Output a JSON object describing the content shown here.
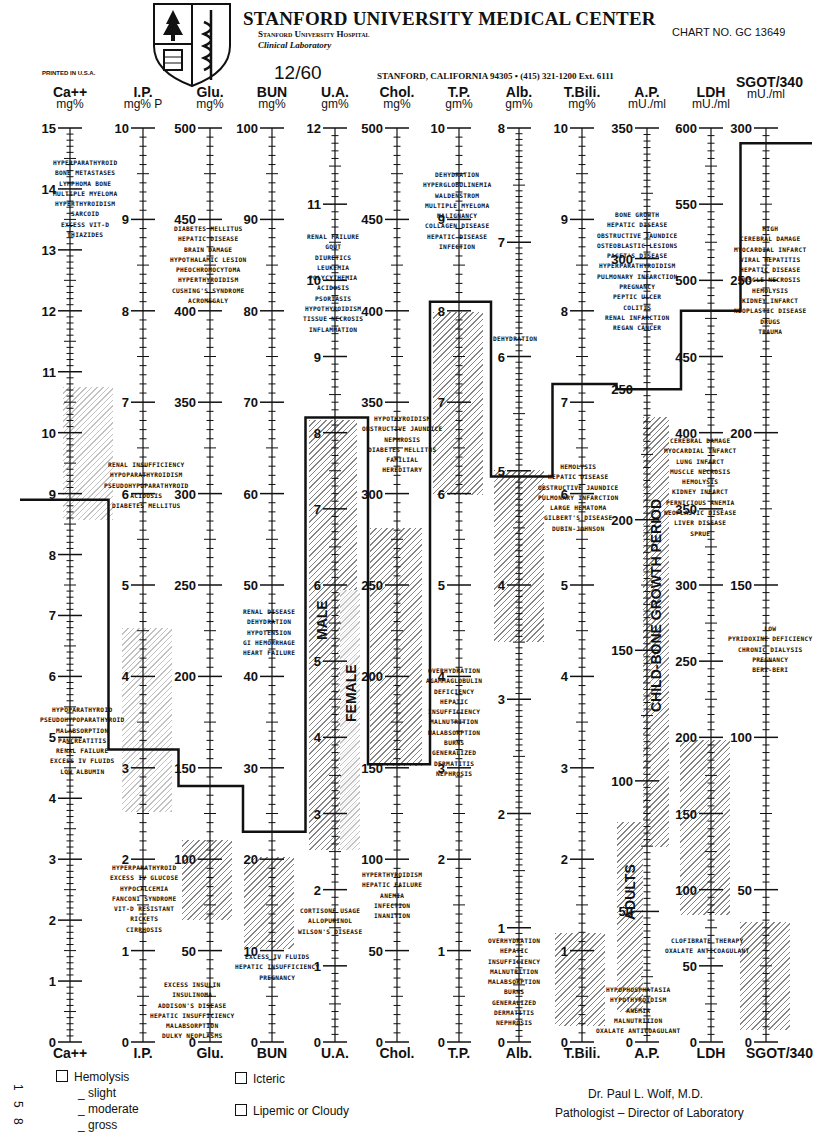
{
  "header": {
    "title": "STANFORD UNIVERSITY MEDICAL CENTER",
    "subtitle": "Stanford University Hospital",
    "department": "Clinical Laboratory",
    "chart_no": "CHART NO. GC 13649",
    "date": "12/60",
    "address": "STANFORD, CALIFORNIA 94305 • (415) 321-1200 Ext. 6111",
    "printed": "PRINTED IN U.S.A."
  },
  "legend": {
    "hemolysis": "Hemolysis",
    "slight": "_ slight",
    "moderate": "_ moderate",
    "gross": "_ gross",
    "icteric": "Icteric",
    "lipemic": "Lipemic or Cloudy",
    "side_numbers": [
      "1",
      "5",
      "8"
    ]
  },
  "signature": {
    "name": "Dr. Paul L. Wolf, M.D.",
    "title": "Pathologist – Director of Laboratory"
  },
  "band_labels": {
    "male": "MALE",
    "female": "FEMALE",
    "child": "CHILD-BONE GROWTH PERIOD",
    "adults": "ADULTS"
  },
  "chart_data": {
    "type": "line",
    "subtitle": "Patient step-line across 12 analytes with normal ranges (hatched)",
    "x": [
      "Ca++",
      "I.P.",
      "Glu.",
      "BUN",
      "U.A.",
      "Chol.",
      "T.P.",
      "Alb.",
      "T.Bili.",
      "A.P.",
      "LDH",
      "SGOT/340"
    ],
    "units": [
      "mg%",
      "mg% P",
      "mg%",
      "mg%",
      "gm%",
      "mg%",
      "gm%",
      "gm%",
      "mg%",
      "mU./ml",
      "mU./ml",
      "mU./ml"
    ],
    "axis_max": [
      15,
      10,
      500,
      100,
      12,
      500,
      10,
      8,
      10,
      350,
      600,
      300
    ],
    "axis_labels": [
      [
        "0",
        "1",
        "2",
        "3",
        "4",
        "5",
        "6",
        "7",
        "8",
        "9",
        "10",
        "11",
        "12",
        "13",
        "14",
        "15"
      ],
      [
        "0",
        "1",
        "2",
        "3",
        "4",
        "5",
        "6",
        "7",
        "8",
        "9",
        "10"
      ],
      [
        "0",
        "50",
        "100",
        "150",
        "200",
        "250",
        "300",
        "350",
        "400",
        "450",
        "500"
      ],
      [
        "0",
        "10",
        "20",
        "30",
        "40",
        "50",
        "60",
        "70",
        "80",
        "90",
        "100"
      ],
      [
        "0",
        "1",
        "2",
        "3",
        "4",
        "5",
        "6",
        "7",
        "8",
        "9",
        "10",
        "11",
        "12"
      ],
      [
        "0",
        "50",
        "100",
        "150",
        "200",
        "250",
        "300",
        "350",
        "400",
        "450",
        "500"
      ],
      [
        "0",
        "1",
        "2",
        "3",
        "4",
        "5",
        "6",
        "7",
        "8",
        "9",
        "10"
      ],
      [
        "0",
        "1",
        "2",
        "3",
        "4",
        "5",
        "6",
        "7",
        "8"
      ],
      [
        "0",
        "1",
        "2",
        "3",
        "4",
        "5",
        "6",
        "7",
        "8",
        "9",
        "10"
      ],
      [
        "0",
        "50",
        "100",
        "150",
        "200",
        "250",
        "300",
        "350"
      ],
      [
        "0",
        "50",
        "100",
        "150",
        "200",
        "250",
        "300",
        "350",
        "400",
        "450",
        "500",
        "550",
        "600"
      ],
      [
        "0",
        "50",
        "100",
        "150",
        "200",
        "250",
        "300"
      ]
    ],
    "series": [
      {
        "name": "Patient result",
        "values": [
          8.9,
          3.2,
          140,
          23,
          8.2,
          152,
          8.1,
          4.95,
          7.2,
          250,
          480,
          295
        ]
      },
      {
        "name": "Normal low",
        "values": [
          8.5,
          2.5,
          65,
          10,
          3.0,
          150,
          6.0,
          3.5,
          0.1,
          30,
          90,
          5
        ]
      },
      {
        "name": "Normal high",
        "values": [
          10.6,
          4.5,
          100,
          20,
          7.0,
          270,
          8.0,
          5.0,
          1.2,
          85,
          200,
          40
        ]
      }
    ],
    "sex_ranges": {
      "U.A.": {
        "male": [
          2.5,
          8.0
        ],
        "female": [
          2.0,
          6.0
        ]
      }
    },
    "ap_ranges": {
      "child_bone_growth": [
        70,
        215
      ],
      "adults": [
        20,
        85
      ]
    },
    "annotations": {
      "Ca++ high": [
        "HYPERPARATHYROID",
        "BONE METASTASES",
        "LYMPHOMA BONE",
        "MULTIPLE MYELOMA",
        "HYPERTHYROIDISM",
        "SARCOID",
        "EXCESS VIT-D",
        "THIAZIDES"
      ],
      "Ca++ low": [
        "HYPOPARATHYROID",
        "PSEUDOHYPOPARATHYROID",
        "MALABSORPTION",
        "PANCREATITIS",
        "RENAL FAILURE",
        "EXCESS IV FLUIDS",
        "LOW ALBUMIN"
      ],
      "I.P. high": [
        "RENAL INSUFFICIENCY",
        "HYPOPARATHYROIDISM",
        "PSEUDOHYPOPARATHYROID",
        "ACIDOSIS",
        "DIABETES MELLITUS"
      ],
      "I.P. low": [
        "HYPERPARATHYROID",
        "EXCESS IV GLUCOSE",
        "HYPOCALCEMIA",
        "FANCONI SYNDROME",
        "VIT-D RESISTANT",
        "RICKETS",
        "CIRRHOSIS"
      ],
      "Glu. high": [
        "DIABETES MELLITUS",
        "HEPATIC DISEASE",
        "BRAIN DAMAGE",
        "HYPOTHALAMIC LESION",
        "PHEOCHROMOCYTOMA",
        "HYPERTHYROIDISM",
        "CUSHING'S SYNDROME",
        "ACROMEGALY"
      ],
      "Glu. low": [
        "EXCESS INSULIN",
        "INSULINOMA",
        "ADDISON'S DISEASE",
        "HEPATIC INSUFFICIENCY",
        "MALABSORPTION",
        "DULKY NEOPLASMS"
      ],
      "BUN high": [
        "RENAL DISEASE",
        "DEHYDRATION",
        "HYPOTENSION",
        "GI HEMORRHAGE",
        "HEART FAILURE"
      ],
      "BUN low": [
        "EXCESS IV FLUIDS",
        "HEPATIC INSUFFICIENCY",
        "PREGNANCY"
      ],
      "U.A. high": [
        "RENAL FAILURE",
        "GOUT",
        "DIURETICS",
        "LEUKEMIA",
        "POLYCYTHEMIA",
        "ACIDOSIS",
        "PSORIASIS",
        "HYPOTHYROIDISM",
        "TISSUE NECROSIS",
        "INFLAMMATION"
      ],
      "U.A. low": [
        "CORTISONE USAGE",
        "ALLOPURINOL",
        "WILSON'S DISEASE"
      ],
      "Chol. high": [
        "HYPOTHYROIDISM",
        "OBSTRUCTIVE JAUNDICE",
        "NEPHROSIS",
        "DIABETES MELLITUS",
        "FAMILIAL",
        "HEREDITARY"
      ],
      "Chol. low": [
        "HYPERTHYROIDISM",
        "HEPATIC FAILURE",
        "ANEMIA",
        "INFECTION",
        "INANITION"
      ],
      "T.P. high": [
        "DEHYDRATION",
        "HYPERGLOBULINEMIA",
        "WALDENSTROM",
        "MULTIPLE MYELOMA",
        "MALIGNANCY",
        "COLLAGEN DISEASE",
        "HEPATIC DISEASE",
        "INFECTION"
      ],
      "T.P. low": [
        "OVERHYDRATION",
        "AGAMMAGLOBULIN",
        "DEFICIENCY",
        "HEPATIC",
        "INSUFFICIENCY",
        "MALNUTRITION",
        "MALABSORPTION",
        "BURNS",
        "GENERALIZED",
        "DERMATITIS",
        "NEPHROSIS"
      ],
      "Alb. high": [
        "DEHYDRATION"
      ],
      "Alb. low": [
        "OVERHYDRATION",
        "HEPATIC",
        "INSUFFICIENCY",
        "MALNUTRITION",
        "MALABSORPTION",
        "BURNS",
        "GENERALIZED",
        "DERMATITIS",
        "NEPHROSIS"
      ],
      "T.Bili. high": [
        "HEMOLYSIS",
        "HEPATIC DISEASE",
        "OBSTRUCTIVE JAUNDICE",
        "PULMONARY INFARCTION",
        "LARGE HEMATOMA",
        "GILBERT'S DISEASE",
        "DUBIN-JOHNSON"
      ],
      "A.P. high": [
        "BONE GROWTH",
        "HEPATIC DISEASE",
        "OBSTRUCTIVE JAUNDICE",
        "OSTEOBLASTIC LESIONS",
        "PAGET'S DISEASE",
        "HYPERPARATHYROIDISM",
        "PULMONARY INFARCTION",
        "PREGNANCY",
        "PEPTIC ULCER",
        "COLITIS",
        "RENAL INFARCTION",
        "REGAN CANCER"
      ],
      "A.P. low": [
        "HYPOPHOSPHATASIA",
        "HYPOTHYROIDISM",
        "ANEMIA",
        "MALNUTRITION",
        "OXALATE ANTICOAGULANT"
      ],
      "LDH high": [
        "CEREBRAL DAMAGE",
        "MYOCARDIAL INFARCT",
        "LUNG INFARCT",
        "MUSCLE NECROSIS",
        "HEMOLYSIS",
        "KIDNEY INFARCT",
        "PERNICIOUS ANEMIA",
        "NEOPLASTIC DISEASE",
        "LIVER DISEASE",
        "SPRUE"
      ],
      "LDH low": [
        "CLOFIBRATE THERAPY",
        "OXALATE ANTICOAGULANT"
      ],
      "SGOT high": [
        "HIGH",
        "CEREBRAL DAMAGE",
        "MYOCARDIAL INFARCT",
        "VIRAL HEPATITIS",
        "HEPATIC DISEASE",
        "MUSCLE NECROSIS",
        "HEMOLYSIS",
        "KIDNEY INFARCT",
        "NEOPLASTIC DISEASE",
        "DRUGS",
        "TRAUMA"
      ],
      "SGOT low": [
        "LOW",
        "PYRIDOXINE DEFICIENCY",
        "CHRONIC DIALYSIS",
        "PREGNANCY",
        "BERI-BERI"
      ]
    },
    "xlabel": "",
    "ylabel": "",
    "grid": false,
    "legend_position": "none"
  }
}
